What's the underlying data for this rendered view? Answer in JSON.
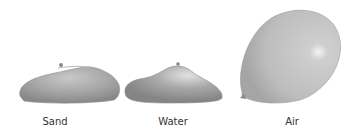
{
  "figure": {
    "items": [
      {
        "label": "Sand",
        "shape": "flattened-balloon"
      },
      {
        "label": "Water",
        "shape": "slumped-balloon"
      },
      {
        "label": "Air",
        "shape": "inflated-balloon"
      }
    ],
    "colors": {
      "balloon_fill": "#a9a9a9",
      "balloon_light": "#d0d0d0",
      "balloon_dark": "#8a8a8a",
      "label": "#333333"
    }
  }
}
